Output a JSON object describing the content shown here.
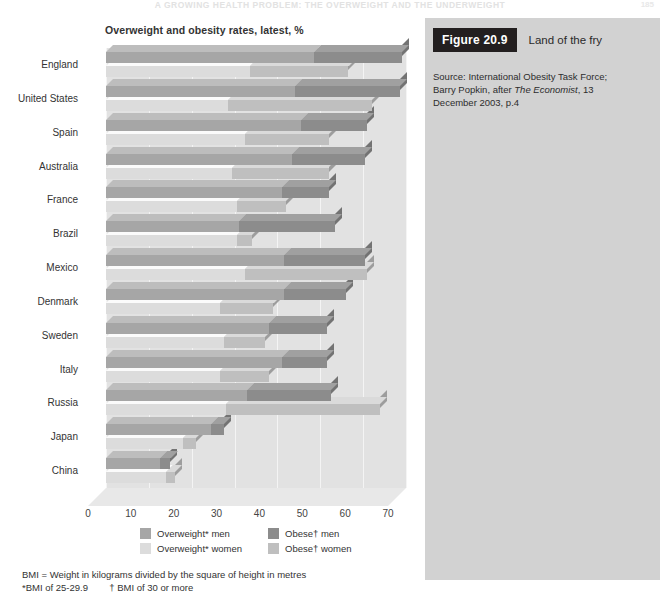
{
  "running_head": {
    "text": "A GROWING HEALTH PROBLEM: THE OVERWEIGHT AND THE UNDERWEIGHT",
    "folio": "185"
  },
  "chart_panel": {
    "title": "Overweight and obesity rates, latest, %"
  },
  "side_panel": {
    "figure_badge": "Figure 20.9",
    "figure_title": "Land of the fry",
    "source_line1": "Source: International Obesity Task Force;",
    "source_line2_a": "Barry Popkin, after ",
    "source_line2_em": "The Economist",
    "source_line2_b": ", 13",
    "source_line3": "December 2003, p.4"
  },
  "legend": {
    "items": [
      {
        "label": "Overweight* men",
        "color": "#a6a6a6"
      },
      {
        "label": "Obese† men",
        "color": "#8c8c8c"
      },
      {
        "label": "Overweight* women",
        "color": "#dcdcdc"
      },
      {
        "label": "Obese† women",
        "color": "#bfbfbf"
      }
    ]
  },
  "footnote": {
    "line1": "BMI = Weight in kilograms divided by the square of height in metres",
    "line2_a": "*BMI of 25-29.9",
    "line2_b": "† BMI of 30 or more"
  },
  "chart_data": {
    "type": "bar",
    "orientation": "horizontal",
    "stacked": true,
    "title": "Overweight and obesity rates, latest, %",
    "xlabel": "",
    "ylabel": "",
    "xlim": [
      0,
      70
    ],
    "xticks": [
      0,
      10,
      20,
      30,
      40,
      50,
      60,
      70
    ],
    "grid": true,
    "legend_position": "bottom",
    "categories": [
      "England",
      "United States",
      "Spain",
      "Australia",
      "France",
      "Brazil",
      "Mexico",
      "Denmark",
      "Sweden",
      "Italy",
      "Russia",
      "Japan",
      "China"
    ],
    "series": [
      {
        "name": "Overweight* men",
        "color": "#a6a6a6",
        "values": [
          48.5,
          44.0,
          45.5,
          43.5,
          41.0,
          31.0,
          41.5,
          41.5,
          38.0,
          41.0,
          33.0,
          24.5,
          12.5
        ]
      },
      {
        "name": "Obese† men",
        "color": "#8c8c8c",
        "values": [
          20.5,
          24.5,
          15.5,
          17.0,
          11.0,
          22.5,
          19.0,
          14.5,
          13.5,
          10.5,
          19.5,
          3.0,
          2.5
        ]
      },
      {
        "name": "Overweight* women",
        "color": "#dcdcdc",
        "values": [
          33.5,
          28.5,
          32.5,
          29.5,
          30.5,
          30.5,
          32.5,
          26.5,
          27.5,
          26.5,
          28.0,
          18.0,
          14.0
        ]
      },
      {
        "name": "Obese† women",
        "color": "#bfbfbf",
        "values": [
          23.0,
          33.5,
          19.5,
          22.5,
          11.5,
          3.5,
          28.5,
          12.5,
          9.5,
          11.5,
          36.0,
          3.0,
          2.0
        ]
      }
    ]
  }
}
